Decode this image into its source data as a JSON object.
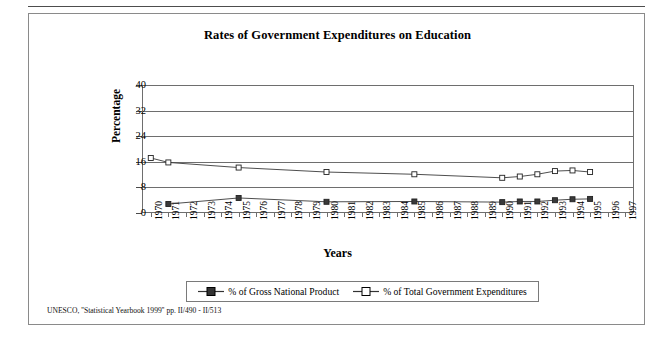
{
  "figure": {
    "title": "Rates of Government Expenditures on Education",
    "source_note": "UNESCO, ''Statistical Yearbook 1999'' pp. II/490 - II/513"
  },
  "legend": {
    "items": [
      {
        "label": "% of Gross National Product",
        "marker": "filled-square",
        "color": "#333333"
      },
      {
        "label": "% of Total Government Expenditures",
        "marker": "open-square",
        "color": "#333333"
      }
    ]
  },
  "chart_data": {
    "type": "line",
    "title": "Rates of Government Expenditures on Education",
    "xlabel": "Years",
    "ylabel": "Percentage",
    "ylim": [
      0,
      40
    ],
    "yticks": [
      0,
      8,
      16,
      24,
      32,
      40
    ],
    "grid": true,
    "legend_position": "bottom",
    "categories": [
      "1970",
      "1971",
      "1972",
      "1973",
      "1974",
      "1975",
      "1976",
      "1977",
      "1978",
      "1979",
      "1980",
      "1981",
      "1982",
      "1983",
      "1984",
      "1985",
      "1986",
      "1987",
      "1988",
      "1989",
      "1990",
      "1991",
      "1992",
      "1993",
      "1994",
      "1995",
      "1996",
      "1997"
    ],
    "series": [
      {
        "name": "% of Gross National Product",
        "marker": "filled-square",
        "points": [
          {
            "x": "1971",
            "y": 2.8
          },
          {
            "x": "1975",
            "y": 4.7
          },
          {
            "x": "1980",
            "y": 3.5
          },
          {
            "x": "1985",
            "y": 3.6
          },
          {
            "x": "1990",
            "y": 3.4
          },
          {
            "x": "1991",
            "y": 3.6
          },
          {
            "x": "1992",
            "y": 3.6
          },
          {
            "x": "1993",
            "y": 4.0
          },
          {
            "x": "1994",
            "y": 4.3
          },
          {
            "x": "1995",
            "y": 4.4
          }
        ]
      },
      {
        "name": "% of Total Government Expenditures",
        "marker": "open-square",
        "points": [
          {
            "x": "1970",
            "y": 17.2
          },
          {
            "x": "1971",
            "y": 15.8
          },
          {
            "x": "1975",
            "y": 14.2
          },
          {
            "x": "1980",
            "y": 12.8
          },
          {
            "x": "1985",
            "y": 12.1
          },
          {
            "x": "1990",
            "y": 11.0
          },
          {
            "x": "1991",
            "y": 11.4
          },
          {
            "x": "1992",
            "y": 12.1
          },
          {
            "x": "1993",
            "y": 13.1
          },
          {
            "x": "1994",
            "y": 13.3
          },
          {
            "x": "1995",
            "y": 12.8
          }
        ]
      }
    ]
  }
}
